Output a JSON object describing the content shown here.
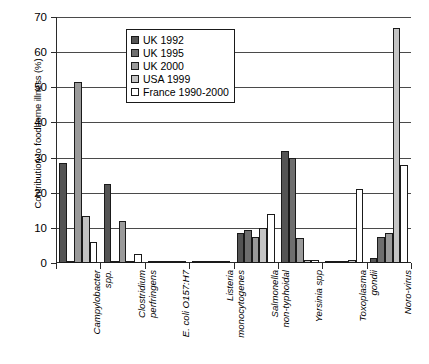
{
  "chart_data": {
    "type": "bar",
    "title": "",
    "xlabel": "",
    "ylabel": "Contribution to foodborne illness (%)",
    "ylim": [
      0,
      70
    ],
    "ytick_step": 10,
    "yticks": [
      0,
      10,
      20,
      30,
      40,
      50,
      60,
      70
    ],
    "grid": true,
    "legend_position": "inside-top-center",
    "categories": [
      "Campylobacter\nspp.",
      "Clostridium\nperfringens",
      "E. coli O157:H7",
      "Listeria\nmonocytogenes",
      "Salmonella\nnon-typhoidal",
      "Yersinia spp",
      "Toxoplasma\ngondii",
      "Noro-virus"
    ],
    "series": [
      {
        "name": "UK 1992",
        "color": "#545454",
        "values": [
          28.5,
          22.5,
          0.5,
          0.2,
          8.5,
          32.0,
          0.2,
          1.5
        ]
      },
      {
        "name": "UK 1995",
        "color": "#6e6e6e",
        "values": [
          0.0,
          0.0,
          0.0,
          0.0,
          9.5,
          30.0,
          0.0,
          7.5
        ]
      },
      {
        "name": "UK 2000",
        "color": "#9a9a9a",
        "values": [
          51.5,
          12.0,
          0.4,
          0.2,
          7.5,
          7.0,
          0.3,
          8.5
        ]
      },
      {
        "name": "USA 1999",
        "color": "#c4c4c4",
        "values": [
          13.5,
          0.6,
          0.5,
          0.2,
          10.0,
          1.0,
          0.8,
          67.0
        ]
      },
      {
        "name": "France 1990-2000",
        "color": "#ffffff",
        "values": [
          6.0,
          2.5,
          0.3,
          0.5,
          14.0,
          0.8,
          21.0,
          28.0
        ]
      }
    ]
  },
  "axis": {
    "y_title": "Contribution to foodborne illness (%)",
    "y_tick_labels": [
      "0",
      "10",
      "20",
      "30",
      "40",
      "50",
      "60",
      "70"
    ]
  },
  "legend": {
    "items": [
      {
        "label": "UK 1992",
        "color": "#545454"
      },
      {
        "label": "UK 1995",
        "color": "#6e6e6e"
      },
      {
        "label": "UK 2000",
        "color": "#9a9a9a"
      },
      {
        "label": "USA 1999",
        "color": "#c4c4c4"
      },
      {
        "label": "France 1990-2000",
        "color": "#ffffff"
      }
    ]
  }
}
